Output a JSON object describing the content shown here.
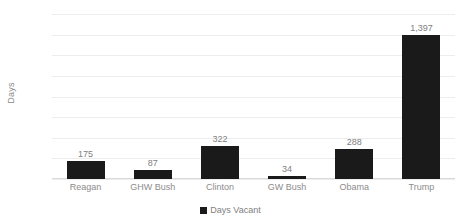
{
  "chart_data": {
    "type": "bar",
    "title": "",
    "xlabel": "",
    "ylabel": "Days",
    "ylim": [
      0,
      1600
    ],
    "ytick_step": 200,
    "grid": true,
    "legend_position": "bottom",
    "categories": [
      "Reagan",
      "GHW Bush",
      "Clinton",
      "GW Bush",
      "Obama",
      "Trump"
    ],
    "values": [
      175,
      87,
      322,
      34,
      288,
      1397
    ],
    "value_labels": [
      "175",
      "87",
      "322",
      "34",
      "288",
      "1,397"
    ],
    "ytick_labels": [
      "1,600",
      "1,400",
      "1,200",
      "1,000",
      "800",
      "600",
      "400",
      "200",
      "0"
    ],
    "ytick_values": [
      1600,
      1400,
      1200,
      1000,
      800,
      600,
      400,
      200,
      0
    ],
    "series": [
      {
        "name": "Days Vacant",
        "values": [
          175,
          87,
          322,
          34,
          288,
          1397
        ]
      }
    ],
    "legend": [
      "Days Vacant"
    ],
    "colors": {
      "bar": "#1a1a1a",
      "gridline": "#ededed",
      "baseline": "#d9d9d9",
      "tick_text": "#8c8c8c",
      "value_text": "#808080",
      "background": "#ffffff"
    }
  }
}
